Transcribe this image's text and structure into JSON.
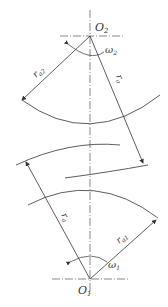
{
  "diagram": {
    "top_center": {
      "label": "O",
      "sub": "2"
    },
    "bottom_center": {
      "label": "O",
      "sub": "1"
    },
    "omega_top": {
      "label": "ω",
      "sub": "2"
    },
    "omega_bottom": {
      "label": "ω",
      "sub": "1"
    },
    "radius_top_left": {
      "label": "r",
      "sub": "a2"
    },
    "radius_top_right": {
      "label": "r",
      "sub": "a"
    },
    "radius_bottom_left": {
      "label": "r",
      "sub": "a"
    },
    "radius_bottom_right": {
      "label": "r",
      "sub": "a1"
    },
    "stroke_color": "#333333"
  }
}
